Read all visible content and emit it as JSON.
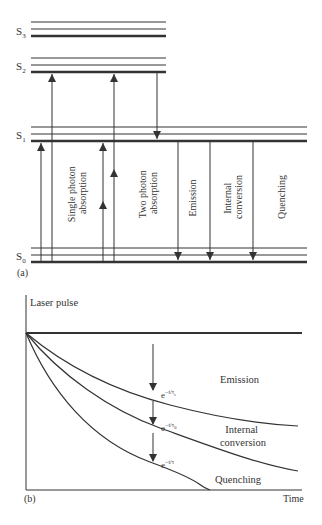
{
  "panel_a": {
    "label": "(a)",
    "levels": [
      {
        "name": "S",
        "sub": "3"
      },
      {
        "name": "S",
        "sub": "2"
      },
      {
        "name": "S",
        "sub": "1"
      },
      {
        "name": "S",
        "sub": "0"
      }
    ],
    "processes": {
      "single_photon": [
        "Single photon",
        "absorption"
      ],
      "two_photon": [
        "Two photon",
        "absorption"
      ],
      "emission": [
        "Emission"
      ],
      "internal_conversion": [
        "Internal",
        "conversion"
      ],
      "quenching": [
        "Quenching"
      ]
    }
  },
  "panel_b": {
    "label": "(b)",
    "y_axis_label": "Laser pulse",
    "x_axis_label": "Time",
    "curves": {
      "emission": {
        "label": "Emission",
        "expr_base": "e",
        "expr_exp": "−t/τ",
        "expr_sub": "e"
      },
      "internal_conversion": {
        "label_lines": [
          "Internal",
          "conversion"
        ],
        "expr_base": "e",
        "expr_exp": "−t/τ",
        "expr_sub": "0"
      },
      "quenching": {
        "label": "Quenching",
        "expr_base": "e",
        "expr_exp": "−t/τ",
        "expr_sub": ""
      }
    }
  },
  "colors": {
    "line": "#333333",
    "text": "#333333",
    "background": "#ffffff"
  }
}
